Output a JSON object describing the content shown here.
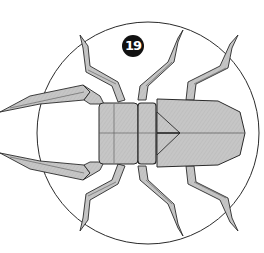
{
  "diagram": {
    "step_number": "19",
    "colors": {
      "paper": "#c4c4c4",
      "paper_dark": "#a9a9a9",
      "outline": "#2a2a2a",
      "crease": "#555555",
      "badge": "#111111",
      "background": "#ffffff"
    },
    "parts": [
      "head",
      "thorax",
      "abdomen",
      "mandibles",
      "legs",
      "view-circle"
    ]
  }
}
